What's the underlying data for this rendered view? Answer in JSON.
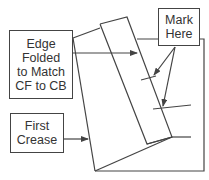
{
  "diagram": {
    "labels": {
      "edge_folded": [
        "Edge",
        "Folded",
        "to Match",
        "CF to CB"
      ],
      "mark_here": [
        "Mark",
        "Here"
      ],
      "first_crease": [
        "First",
        "Crease"
      ]
    },
    "colors": {
      "line": "#444444",
      "text": "#333333",
      "background": "#ffffff"
    }
  }
}
